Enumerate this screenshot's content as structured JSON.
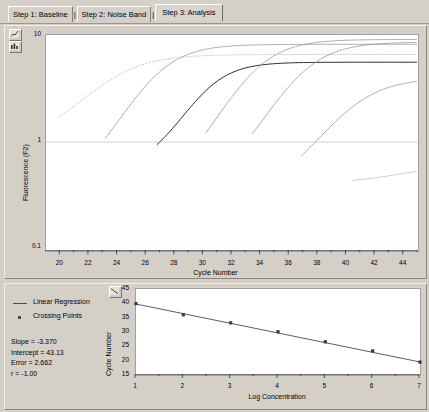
{
  "window": {
    "tabs": [
      {
        "label": "Step 1: Baseline",
        "active": false
      },
      {
        "label": "Step 2: Noise Band",
        "active": false
      },
      {
        "label": "Step 3: Analysis",
        "active": true
      }
    ],
    "separators": [
      "|",
      "|"
    ]
  },
  "toolbar": {
    "chart_icon": "chart-icon",
    "bar_icon": "bar-chart-icon",
    "lower_icon": "chart-icon"
  },
  "chart_data": [
    {
      "id": "amplification",
      "type": "line",
      "title": "",
      "xlabel": "Cycle Number",
      "ylabel": "Fluorescence (F2)",
      "yscale": "log",
      "ylim": [
        0.1,
        10
      ],
      "ytick_labels": [
        "10",
        "1",
        "0.1"
      ],
      "ytick_values": [
        10,
        1,
        0.1
      ],
      "xlim": [
        19,
        45
      ],
      "xtick_labels": [
        "20",
        "22",
        "24",
        "26",
        "28",
        "30",
        "32",
        "34",
        "36",
        "38",
        "40",
        "42",
        "44"
      ],
      "xtick_values": [
        20,
        22,
        24,
        26,
        28,
        30,
        32,
        34,
        36,
        38,
        40,
        42,
        44
      ],
      "minor_xticks": [
        21,
        23,
        25,
        27,
        29,
        31,
        33,
        35,
        37,
        39,
        41,
        43,
        45
      ],
      "grid": false,
      "noise_band_level": 1.0,
      "series": [
        {
          "name": "Sample 1",
          "style": "dotted",
          "crossing_point": 21.0,
          "plateau": 6.6,
          "baseline": 0.95,
          "steep": 0.52
        },
        {
          "name": "Sample 2",
          "style": "solid",
          "crossing_point": 24.3,
          "plateau": 8.2,
          "baseline": 0.32,
          "steep": 0.62
        },
        {
          "name": "Sample 3",
          "style": "solid-dark",
          "crossing_point": 27.8,
          "plateau": 5.6,
          "baseline": 0.55,
          "steep": 0.7
        },
        {
          "name": "Sample 4",
          "style": "solid",
          "crossing_point": 31.2,
          "plateau": 9.1,
          "baseline": 0.3,
          "steep": 0.62
        },
        {
          "name": "Sample 5",
          "style": "solid",
          "crossing_point": 34.5,
          "plateau": 8.6,
          "baseline": 0.3,
          "steep": 0.6
        },
        {
          "name": "Sample 6",
          "style": "solid",
          "crossing_point": 38.0,
          "plateau": 4.0,
          "baseline": 0.3,
          "steep": 0.55
        },
        {
          "name": "Sample 7",
          "style": "solid-faint",
          "crossing_point": 41.5,
          "plateau": 0.62,
          "baseline": 0.42,
          "steep": 0.5
        }
      ]
    },
    {
      "id": "standard-curve",
      "type": "scatter",
      "title": "",
      "xlabel": "Log Concentration",
      "ylabel": "Cycle Number",
      "xlim": [
        1,
        7
      ],
      "ylim": [
        15,
        45
      ],
      "xtick_labels": [
        "1",
        "2",
        "3",
        "4",
        "5",
        "6",
        "7"
      ],
      "xtick_values": [
        1,
        2,
        3,
        4,
        5,
        6,
        7
      ],
      "minor_xticks": [
        1.5,
        2.5,
        3.5,
        4.5,
        5.5,
        6.5
      ],
      "ytick_labels": [
        "45",
        "40",
        "35",
        "30",
        "25",
        "20",
        "15"
      ],
      "ytick_values": [
        45,
        40,
        35,
        30,
        25,
        20,
        15
      ],
      "minor_yticks": [
        42.5,
        37.5,
        32.5,
        27.5,
        22.5,
        17.5
      ],
      "grid": false,
      "points": {
        "x": [
          1,
          2,
          3,
          4,
          5,
          6,
          7
        ],
        "y": [
          39.9,
          36.0,
          33.2,
          30.1,
          26.6,
          23.4,
          19.5
        ]
      },
      "regression": {
        "slope": -3.37,
        "intercept": 43.13,
        "x_start": 1,
        "x_end": 7,
        "y_start": 39.76,
        "y_end": 19.54
      }
    }
  ],
  "legend": {
    "entries": [
      {
        "label": "Linear Regression",
        "marker": "line"
      },
      {
        "label": "Crossing Points",
        "marker": "square"
      }
    ]
  },
  "stats": {
    "slope": "Slope = -3.370",
    "intercept": "Intercept = 43.13",
    "error": "Error = 2.662",
    "r": "r = -1.00"
  },
  "colors": {
    "window_bg": "#d4d0c8",
    "plot_bg": "#ffffff",
    "curve": "#8a8a8a",
    "curve_dark": "#2b2b2b",
    "axis": "#303030",
    "regression_line": "#4a4a4a",
    "point": "#3a3a3a"
  }
}
